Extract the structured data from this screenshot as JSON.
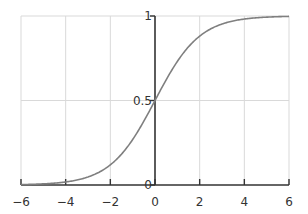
{
  "chart_data": {
    "type": "line",
    "title": "",
    "xlabel": "",
    "ylabel": "",
    "function": "sigmoid 1/(1+e^-x)",
    "xlim": [
      -6,
      6
    ],
    "ylim": [
      0,
      1
    ],
    "grid": true,
    "legend": null,
    "x_ticks": [
      -6,
      -4,
      -2,
      0,
      2,
      4,
      6
    ],
    "x_tick_labels": [
      "−6",
      "−4",
      "−2",
      "0",
      "2",
      "4",
      "6"
    ],
    "y_ticks": [
      0,
      0.5,
      1
    ],
    "y_tick_labels": [
      "0",
      "0.5",
      "1"
    ],
    "series": [
      {
        "name": "sigmoid",
        "color": "#7f7f7f",
        "x": [
          -6,
          -5,
          -4,
          -3,
          -2,
          -1,
          0,
          1,
          2,
          3,
          4,
          5,
          6
        ],
        "values": [
          0.0025,
          0.0067,
          0.018,
          0.047,
          0.119,
          0.269,
          0.5,
          0.731,
          0.881,
          0.953,
          0.982,
          0.993,
          0.9975
        ]
      }
    ]
  },
  "colors": {
    "axis": "#333333",
    "grid": "#d9d9d9",
    "curve": "#7f7f7f"
  }
}
